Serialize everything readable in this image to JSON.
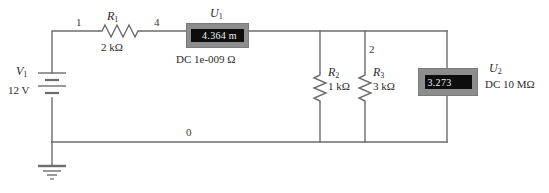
{
  "diagram": {
    "background_color": "#ffffff",
    "wire_color": "#6d6d6d",
    "meter_body_color": "#8d8d8d",
    "meter_screen_color": "#0d0d0d",
    "meter_text_color": "#f2f2f2"
  },
  "nodes": [
    {
      "id": "node-1",
      "label": "1"
    },
    {
      "id": "node-4",
      "label": "4"
    },
    {
      "id": "node-2",
      "label": "2"
    },
    {
      "id": "node-0",
      "label": "0"
    }
  ],
  "components": {
    "v1": {
      "ref": "V",
      "ref_sub": "1",
      "value": "12 V",
      "type": "dc-voltage-source"
    },
    "r1": {
      "ref": "R",
      "ref_sub": "1",
      "value": "2 kΩ",
      "type": "resistor"
    },
    "r2": {
      "ref": "R",
      "ref_sub": "2",
      "value": "1 kΩ",
      "type": "resistor"
    },
    "r3": {
      "ref": "R",
      "ref_sub": "3",
      "value": "3 kΩ",
      "type": "resistor"
    },
    "u1": {
      "ref": "U",
      "ref_sub": "1",
      "reading": "4.364 m",
      "spec": "DC 1e-009 Ω",
      "type": "ammeter"
    },
    "u2": {
      "ref": "U",
      "ref_sub": "2",
      "reading": "3.273",
      "spec": "DC 10 MΩ",
      "type": "voltmeter"
    },
    "ground": {
      "type": "ground-symbol",
      "label": ""
    }
  }
}
